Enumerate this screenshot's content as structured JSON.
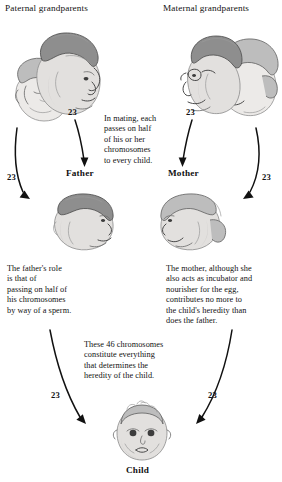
{
  "diagram": {
    "width": 282,
    "height": 482,
    "background_color": "#ffffff",
    "ink_color": "#111111",
    "sketch_color": "#6f6f6f"
  },
  "labels": {
    "paternal_grandparents": "Paternal grandparents",
    "maternal_grandparents": "Maternal grandparents",
    "father": "Father",
    "mother": "Mother",
    "child": "Child"
  },
  "chromosome_counts": {
    "paternal_gp_to_father": "23",
    "maternal_gp_to_mother": "23",
    "paternal_gp_to_child_left": "23",
    "maternal_gp_to_child_right": "23",
    "father_to_child": "23",
    "mother_to_child": "23"
  },
  "captions": {
    "mating": {
      "lines": [
        "In mating, each",
        "passes on half",
        "of his or her",
        "chromosomes",
        "to every child."
      ]
    },
    "father_role": {
      "lines": [
        "The father's role",
        "is that of",
        "passing on half of",
        "his chromosomes",
        "by way of a sperm."
      ]
    },
    "mother_role": {
      "lines": [
        "The mother, although she",
        "also acts as incubator and",
        "nourisher for the egg,",
        "contributes no more to",
        "the child's heredity than",
        "does the father."
      ]
    },
    "child_total": {
      "lines": [
        "These 46 chromosomes",
        "constitute everything",
        "that determines the",
        "heredity of the child."
      ]
    }
  },
  "figures": {
    "paternal_grandparents": "paternal-grandparents-portrait",
    "maternal_grandparents": "maternal-grandparents-portrait",
    "father": "father-portrait",
    "mother": "mother-portrait",
    "child": "child-portrait"
  },
  "arrows": {
    "gp_left_to_father": "curved-arrow-down-right",
    "gp_right_to_mother": "curved-arrow-down-left",
    "gp_left_to_child": "long-curved-arrow-down",
    "gp_right_to_child": "long-curved-arrow-down",
    "father_to_child": "curved-arrow-down-right",
    "mother_to_child": "curved-arrow-down-left"
  }
}
